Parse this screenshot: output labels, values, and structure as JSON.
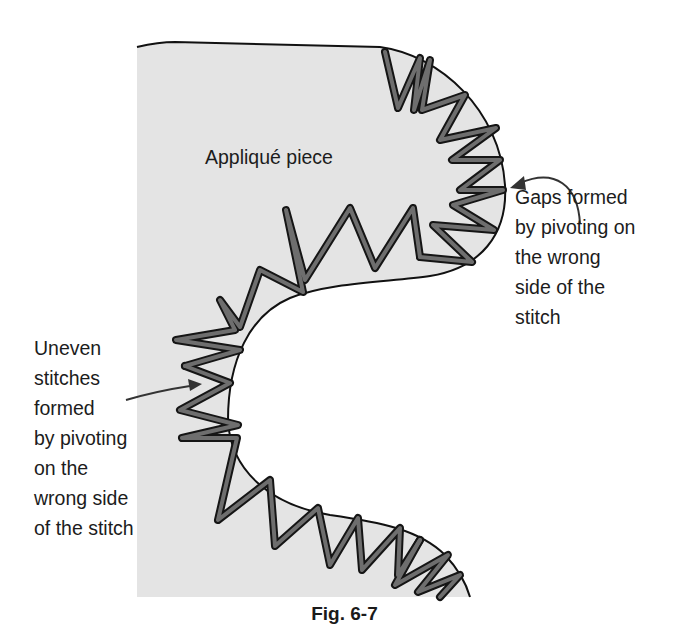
{
  "figure": {
    "caption": "Fig. 6-7",
    "piece_label": "Appliqué piece",
    "callouts": [
      {
        "id": "gaps",
        "text": "Gaps formed\nby pivoting on\nthe wrong\nside of the\nstitch",
        "points_to": "outer convex curve (right bump)"
      },
      {
        "id": "uneven",
        "text": "Uneven\nstitches\nformed\nby pivoting\non the\nwrong side\nof the stitch",
        "points_to": "inner concave curve (left)"
      }
    ],
    "colors": {
      "fabric_fill": "#e4e4e4",
      "outline": "#111111",
      "stitch_fill": "#6e6e6e",
      "stitch_outline": "#151515",
      "background": "#ffffff"
    }
  }
}
